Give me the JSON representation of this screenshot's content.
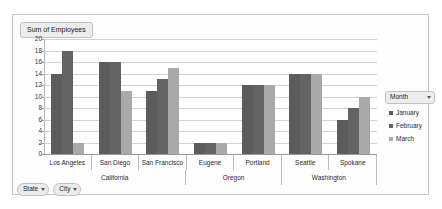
{
  "title": "Sum of Employees",
  "legend": {
    "header": "Month",
    "items": [
      {
        "label": "January",
        "color": "#5c5c5c"
      },
      {
        "label": "February",
        "color": "#636363"
      },
      {
        "label": "March",
        "color": "#a9a9a9"
      }
    ]
  },
  "field_buttons": [
    {
      "label": "State"
    },
    {
      "label": "City"
    }
  ],
  "chart_data": {
    "type": "bar",
    "title": "Sum of Employees",
    "xlabel": "",
    "ylabel": "",
    "ylim": [
      0,
      20
    ],
    "ytick_labels": [
      "20",
      "18",
      "16",
      "14",
      "12",
      "10",
      "8",
      "6",
      "4",
      "2",
      "0"
    ],
    "yticks": [
      20,
      18,
      16,
      14,
      12,
      10,
      8,
      6,
      4,
      2,
      0
    ],
    "grid": true,
    "legend_position": "right",
    "categories": [
      "Los Angeles",
      "San Diego",
      "San Francisco",
      "Eugene",
      "Portland",
      "Seattle",
      "Spokane"
    ],
    "groups": [
      {
        "label": "California",
        "categories": [
          "Los Angeles",
          "San Diego",
          "San Francisco"
        ]
      },
      {
        "label": "Oregon",
        "categories": [
          "Eugene",
          "Portland"
        ]
      },
      {
        "label": "Washington",
        "categories": [
          "Seattle",
          "Spokane"
        ]
      }
    ],
    "series": [
      {
        "name": "January",
        "color": "#5c5c5c",
        "values": [
          14,
          16,
          11,
          2,
          12,
          14,
          6
        ]
      },
      {
        "name": "February",
        "color": "#636363",
        "values": [
          18,
          16,
          13,
          2,
          12,
          14,
          8
        ]
      },
      {
        "name": "March",
        "color": "#a9a9a9",
        "values": [
          2,
          11,
          15,
          2,
          12,
          14,
          10
        ]
      }
    ]
  }
}
